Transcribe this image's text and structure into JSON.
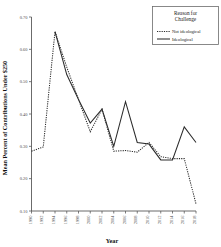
{
  "chart_data": {
    "type": "line",
    "title": "",
    "xlabel": "Year",
    "ylabel": "Mean Percent of Contributions Under $250",
    "x": [
      1990,
      1992,
      1994,
      1996,
      1998,
      2000,
      2002,
      2004,
      2006,
      2008,
      2010,
      2012,
      2014,
      2016,
      2018
    ],
    "categories": [
      "1990",
      "1992",
      "1994",
      "1996",
      "1998",
      "2000",
      "2002",
      "2004",
      "2006",
      "2008",
      "2010",
      "2012",
      "2014",
      "2016",
      "2018"
    ],
    "xlim": [
      1990,
      2018
    ],
    "ylim": [
      0.1,
      0.7
    ],
    "yticks": [
      0.1,
      0.2,
      0.3,
      0.4,
      0.5,
      0.6,
      0.7
    ],
    "ytick_labels": [
      "0.10",
      "0.20",
      "0.30",
      "0.40",
      "0.50",
      "0.60",
      "0.70"
    ],
    "grid": false,
    "legend_position": "top-right",
    "legend_title": "Reason for Challenge",
    "series": [
      {
        "name": "Not ideological",
        "style": "dotted",
        "color": "#2b2b2b",
        "x": [
          1990,
          1992,
          1994,
          1996,
          1998,
          2000,
          2002,
          2004,
          2006,
          2008,
          2010,
          2012,
          2014,
          2016,
          2018
        ],
        "values": [
          0.285,
          0.298,
          0.655,
          0.545,
          0.445,
          0.345,
          0.415,
          0.285,
          0.287,
          0.282,
          0.312,
          0.268,
          0.262,
          0.262,
          0.122
        ]
      },
      {
        "name": "Ideological",
        "style": "solid",
        "color": "#2b2b2b",
        "x": [
          1994,
          1996,
          1998,
          2000,
          2002,
          2004,
          2006,
          2008,
          2010,
          2012,
          2014,
          2016,
          2018
        ],
        "values": [
          0.655,
          0.522,
          0.445,
          0.372,
          0.415,
          0.3,
          0.438,
          0.312,
          0.307,
          0.258,
          0.258,
          0.36,
          0.312
        ]
      }
    ]
  },
  "legend": {
    "title_line1": "Reason for",
    "title_line2": "Challenge",
    "entries": [
      {
        "label": "Not ideological",
        "style": "dotted"
      },
      {
        "label": "Ideological",
        "style": "solid"
      }
    ]
  },
  "axes": {
    "x_title": "Year",
    "y_title": "Mean Percent of Contributions Under $250"
  }
}
